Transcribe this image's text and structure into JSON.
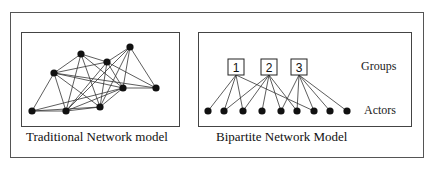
{
  "figure": {
    "left_panel": {
      "caption": "Traditional Network model",
      "nodes": [
        {
          "id": "A",
          "x": 32,
          "y": 111
        },
        {
          "id": "B",
          "x": 66,
          "y": 111
        },
        {
          "id": "C",
          "x": 100,
          "y": 107
        },
        {
          "id": "D",
          "x": 54,
          "y": 73
        },
        {
          "id": "E",
          "x": 81,
          "y": 54
        },
        {
          "id": "F",
          "x": 107,
          "y": 62
        },
        {
          "id": "G",
          "x": 130,
          "y": 47
        },
        {
          "id": "H",
          "x": 123,
          "y": 88
        },
        {
          "id": "I",
          "x": 156,
          "y": 88
        }
      ],
      "edges": [
        [
          "A",
          "B"
        ],
        [
          "A",
          "D"
        ],
        [
          "A",
          "C"
        ],
        [
          "A",
          "H"
        ],
        [
          "B",
          "D"
        ],
        [
          "B",
          "E"
        ],
        [
          "B",
          "C"
        ],
        [
          "B",
          "F"
        ],
        [
          "B",
          "H"
        ],
        [
          "B",
          "G"
        ],
        [
          "C",
          "D"
        ],
        [
          "C",
          "E"
        ],
        [
          "C",
          "F"
        ],
        [
          "C",
          "G"
        ],
        [
          "C",
          "H"
        ],
        [
          "D",
          "E"
        ],
        [
          "D",
          "F"
        ],
        [
          "D",
          "H"
        ],
        [
          "D",
          "I"
        ],
        [
          "E",
          "F"
        ],
        [
          "E",
          "H"
        ],
        [
          "F",
          "G"
        ],
        [
          "F",
          "H"
        ],
        [
          "F",
          "I"
        ],
        [
          "G",
          "H"
        ],
        [
          "G",
          "I"
        ],
        [
          "H",
          "I"
        ]
      ]
    },
    "right_panel": {
      "caption": "Bipartite Network Model",
      "groups_label": "Groups",
      "actors_label": "Actors",
      "groups": [
        {
          "label": "1",
          "x": 236,
          "y": 67
        },
        {
          "label": "2",
          "x": 269,
          "y": 67
        },
        {
          "label": "3",
          "x": 299,
          "y": 67
        }
      ],
      "actors": [
        {
          "x": 208,
          "y": 111
        },
        {
          "x": 224,
          "y": 111
        },
        {
          "x": 243,
          "y": 111
        },
        {
          "x": 262,
          "y": 111
        },
        {
          "x": 281,
          "y": 111
        },
        {
          "x": 297,
          "y": 111
        },
        {
          "x": 314,
          "y": 111
        },
        {
          "x": 330,
          "y": 111
        },
        {
          "x": 347,
          "y": 111
        }
      ],
      "memberships": [
        [
          0,
          0
        ],
        [
          0,
          1
        ],
        [
          0,
          2
        ],
        [
          0,
          6
        ],
        [
          1,
          1
        ],
        [
          1,
          2
        ],
        [
          1,
          3
        ],
        [
          1,
          4
        ],
        [
          1,
          5
        ],
        [
          2,
          4
        ],
        [
          2,
          5
        ],
        [
          2,
          6
        ],
        [
          2,
          7
        ],
        [
          2,
          8
        ]
      ]
    }
  }
}
